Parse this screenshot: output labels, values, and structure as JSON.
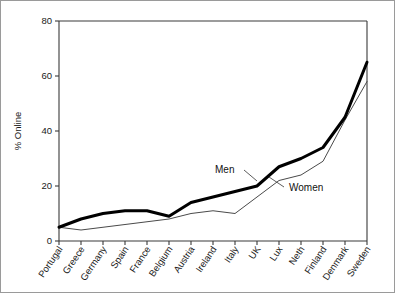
{
  "chart_data": {
    "type": "line",
    "title": "",
    "xlabel": "",
    "ylabel": "% Online",
    "ylim": [
      0,
      80
    ],
    "yticks": [
      0,
      20,
      40,
      60,
      80
    ],
    "grid": false,
    "legend_position": "inline-annotation",
    "categories": [
      "Portugal",
      "Greece",
      "Germany",
      "Spain",
      "France",
      "Belgium",
      "Austria",
      "Ireland",
      "Italy",
      "UK",
      "Lux",
      "Neth",
      "Finland",
      "Denmark",
      "Sweden"
    ],
    "series": [
      {
        "name": "Men",
        "values": [
          5,
          8,
          10,
          11,
          11,
          9,
          14,
          16,
          18,
          20,
          27,
          30,
          34,
          45,
          65
        ],
        "color": "#000000",
        "line_width": "thick"
      },
      {
        "name": "Women",
        "values": [
          5,
          4,
          5,
          6,
          7,
          8,
          10,
          11,
          10,
          16,
          22,
          24,
          29,
          44,
          58
        ],
        "color": "#4a4a4a",
        "line_width": "thin"
      }
    ],
    "annotations": [
      {
        "text": "Men",
        "x_category": "Italy",
        "value": 18
      },
      {
        "text": "Women",
        "x_category": "Neth",
        "value": 24
      }
    ]
  },
  "figure": {
    "background": "#ffffff",
    "border_color": "#9a9a9a",
    "axis_color": "#3a3a3a"
  }
}
